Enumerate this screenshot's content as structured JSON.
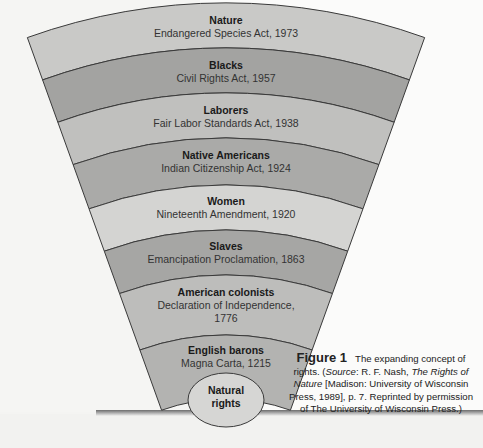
{
  "figure": {
    "title": "Figure 1",
    "caption_main": "The expanding concept of rights.",
    "caption_source_prefix": "(Source: R. F. Nash, ",
    "caption_source_italic_book": "The Rights of Nature",
    "caption_source_rest": " [Madison: University of Wisconsin Press, 1989], p. 7. Reprinted by permission of The University of Wisconsin Press.)",
    "source_label": "Source",
    "book_title": "The Rights of Nature"
  },
  "diagram": {
    "center": {
      "label_line1": "Natural",
      "label_line2": "rights"
    },
    "bands": [
      {
        "title": "Nature",
        "subtitle": "Endangered Species Act, 1973",
        "color": "#c9c9c7"
      },
      {
        "title": "Blacks",
        "subtitle": "Civil Rights Act, 1957",
        "color": "#a3a3a1"
      },
      {
        "title": "Laborers",
        "subtitle": "Fair Labor Standards Act, 1938",
        "color": "#c0c0be"
      },
      {
        "title": "Native Americans",
        "subtitle": "Indian Citizenship Act, 1924",
        "color": "#aaaaa8"
      },
      {
        "title": "Women",
        "subtitle": "Nineteenth Amendment, 1920",
        "color": "#d4d4d2"
      },
      {
        "title": "Slaves",
        "subtitle": "Emancipation Proclamation, 1863",
        "color": "#a6a6a4"
      },
      {
        "title": "American colonists",
        "subtitle": "Declaration of Independence,",
        "subtitle2": "1776",
        "color": "#bdbdbb"
      },
      {
        "title": "English barons",
        "subtitle": "Magna Carta, 1215",
        "color": "#b3b3b1"
      }
    ],
    "center_color": "#d6d6d4",
    "stroke_color": "#3a3a3a"
  }
}
